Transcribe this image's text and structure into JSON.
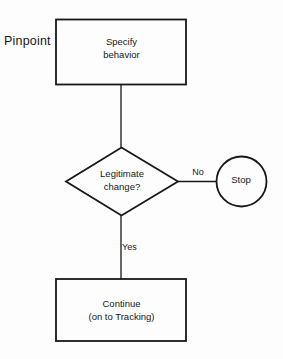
{
  "diagram": {
    "background_color": "#fdfdfd",
    "stroke_color": "#16181a",
    "text_color": "#16181a",
    "section_label": "Pinpoint",
    "nodes": {
      "specify": {
        "shape": "process-box",
        "line1": "Specify",
        "line2": "behavior",
        "text": "Specify\nbehavior"
      },
      "decision": {
        "shape": "diamond",
        "line1": "Legitimate",
        "line2": "change?",
        "text": "Legitimate\nchange?"
      },
      "stop": {
        "shape": "circle",
        "text": "Stop"
      },
      "continue": {
        "shape": "process-box",
        "line1": "Continue",
        "line2": "(on to Tracking)",
        "text": "Continue\n(on to Tracking)"
      }
    },
    "edges": {
      "specify_to_decision": {
        "label": ""
      },
      "decision_to_stop": {
        "label": "No"
      },
      "decision_to_continue": {
        "label": "Yes"
      }
    }
  }
}
